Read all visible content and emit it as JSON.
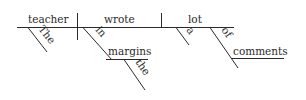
{
  "diagram": {
    "type": "sentence-diagram",
    "sentence": "The teacher wrote a lot of comments in the margins",
    "subject": "teacher",
    "verb": "wrote",
    "object": "lot",
    "modifiers": {
      "subject_article": "The",
      "object_article": "a",
      "object_preposition": "of",
      "object_prep_object": "comments",
      "verb_preposition": "in",
      "verb_prep_object": "margins",
      "verb_prep_article": "the"
    }
  }
}
